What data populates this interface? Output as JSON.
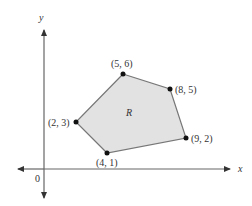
{
  "diagram": {
    "region_label": "R",
    "axes": {
      "x_label": "x",
      "y_label": "y",
      "origin_label": "0"
    },
    "colors": {
      "fill": "#e2e2e2",
      "edge": "#777777",
      "axis": "#666666",
      "vertex": "#111111"
    },
    "vertices": [
      {
        "label": "(5, 6)"
      },
      {
        "label": "(8, 5)"
      },
      {
        "label": "(9, 2)"
      },
      {
        "label": "(4, 1)"
      },
      {
        "label": "(2, 3)"
      }
    ]
  }
}
